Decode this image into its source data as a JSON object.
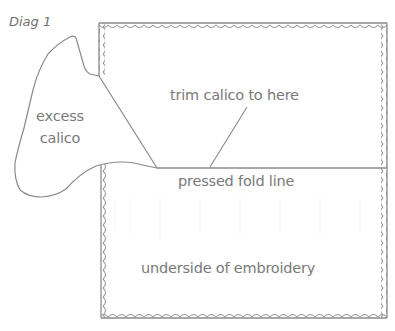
{
  "diagram": {
    "title": "Diag 1",
    "labels": {
      "excess_line1": "excess",
      "excess_line2": "calico",
      "trim": "trim calico to here",
      "fold": "pressed fold line",
      "underside": "underside of embroidery"
    },
    "colors": {
      "line": "#8a8a8a",
      "stitch": "#9a9a9a",
      "text": "#7a7a7a",
      "background": "#ffffff"
    }
  }
}
